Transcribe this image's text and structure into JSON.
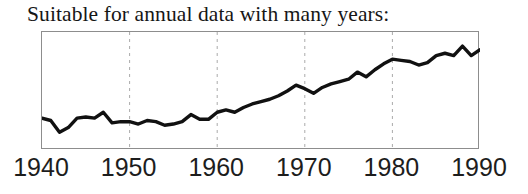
{
  "figure": {
    "title": "Suitable for annual data with many years:"
  },
  "axis": {
    "tick_labels": [
      "1940",
      "1950",
      "1960",
      "1970",
      "1980",
      "1990"
    ]
  },
  "style": {
    "line_color": "#111111",
    "frame_color": "#8d8d8d",
    "gridline_color": "#aaaaaa",
    "background": "#ffffff",
    "title_color": "#161616",
    "tick_label_color": "#1d1d1d"
  },
  "chart_data": {
    "type": "line",
    "title": "Suitable for annual data with many years:",
    "xlabel": "",
    "ylabel": "",
    "xlim": [
      1940,
      1990
    ],
    "ylim": [
      0,
      100
    ],
    "grid": "vertical-dashed-at-decades",
    "gridlines_x": [
      1950,
      1960,
      1970,
      1980
    ],
    "legend": "none",
    "x": [
      1940,
      1941,
      1942,
      1943,
      1944,
      1945,
      1946,
      1947,
      1948,
      1949,
      1950,
      1951,
      1952,
      1953,
      1954,
      1955,
      1956,
      1957,
      1958,
      1959,
      1960,
      1961,
      1962,
      1963,
      1964,
      1965,
      1966,
      1967,
      1968,
      1969,
      1970,
      1971,
      1972,
      1973,
      1974,
      1975,
      1976,
      1977,
      1978,
      1979,
      1980,
      1981,
      1982,
      1983,
      1984,
      1985,
      1986,
      1987,
      1988,
      1989,
      1990
    ],
    "values": [
      27,
      25,
      15,
      19,
      27,
      28,
      27,
      32,
      23,
      24,
      24,
      22,
      25,
      24,
      21,
      22,
      24,
      30,
      26,
      26,
      32,
      34,
      32,
      36,
      39,
      41,
      43,
      46,
      50,
      55,
      52,
      48,
      53,
      56,
      58,
      60,
      66,
      62,
      68,
      73,
      77,
      76,
      75,
      72,
      74,
      80,
      82,
      80,
      88,
      80,
      85
    ],
    "series": [
      {
        "name": "annual series",
        "values": [
          27,
          25,
          15,
          19,
          27,
          28,
          27,
          32,
          23,
          24,
          24,
          22,
          25,
          24,
          21,
          22,
          24,
          30,
          26,
          26,
          32,
          34,
          32,
          36,
          39,
          41,
          43,
          46,
          50,
          55,
          52,
          48,
          53,
          56,
          58,
          60,
          66,
          62,
          68,
          73,
          77,
          76,
          75,
          72,
          74,
          80,
          82,
          80,
          88,
          80,
          85
        ]
      }
    ]
  }
}
